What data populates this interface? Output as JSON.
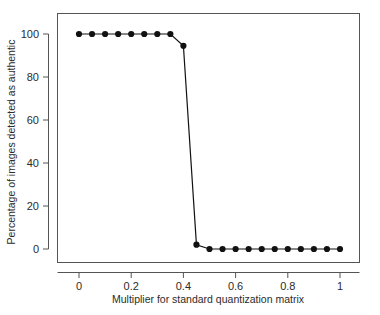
{
  "chart_data": {
    "type": "line",
    "title": "",
    "xlabel": "Multiplier for standard quantization matrix",
    "ylabel": "Percentage of images detected as authentic",
    "xlim": [
      -0.04,
      1.06
    ],
    "ylim": [
      -6,
      107
    ],
    "xticks": [
      0,
      0.2,
      0.4,
      0.6,
      0.8,
      1
    ],
    "xtick_labels": [
      "0",
      "0.2",
      "0.4",
      "0.6",
      "0.8",
      "1"
    ],
    "yticks": [
      0,
      20,
      40,
      60,
      80,
      100
    ],
    "ytick_labels": [
      "0",
      "20",
      "40",
      "60",
      "80",
      "100"
    ],
    "grid": false,
    "legend": false,
    "marker": "filled-circle",
    "line_color": "#111111",
    "marker_color": "#111111",
    "x": [
      0,
      0.05,
      0.1,
      0.15,
      0.2,
      0.25,
      0.3,
      0.35,
      0.4,
      0.45,
      0.5,
      0.55,
      0.6,
      0.65,
      0.7,
      0.75,
      0.8,
      0.85,
      0.9,
      0.95,
      1
    ],
    "values": [
      100,
      100,
      100,
      100,
      100,
      100,
      100,
      100,
      94.5,
      2,
      0,
      0,
      0,
      0,
      0,
      0,
      0,
      0,
      0,
      0,
      0
    ],
    "series": [
      {
        "name": "Percentage of images detected as authentic",
        "values": [
          100,
          100,
          100,
          100,
          100,
          100,
          100,
          100,
          94.5,
          2,
          0,
          0,
          0,
          0,
          0,
          0,
          0,
          0,
          0,
          0,
          0
        ]
      }
    ]
  }
}
